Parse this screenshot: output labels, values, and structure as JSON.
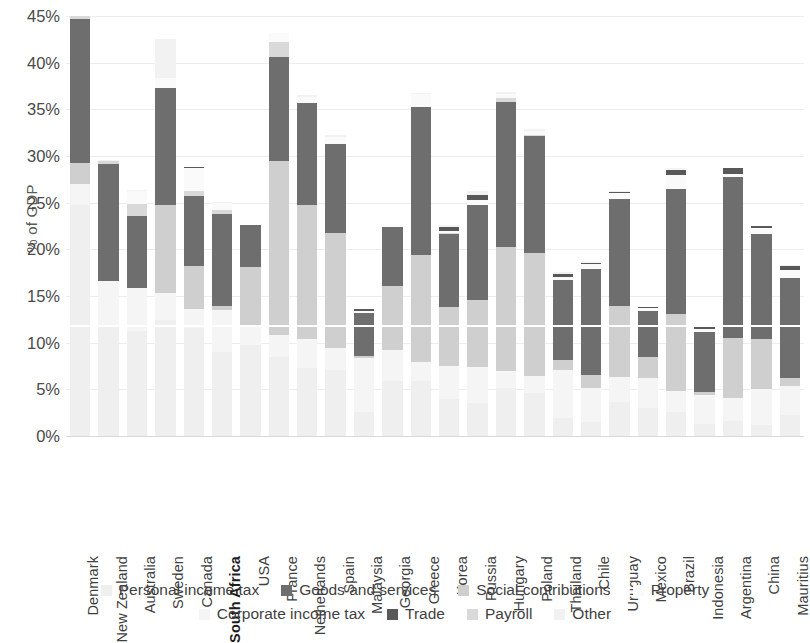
{
  "chart_data": {
    "type": "bar",
    "subtype": "stacked-bar",
    "title": "",
    "xlabel": "",
    "ylabel": "% of GDP",
    "ylim": [
      0,
      45
    ],
    "ytick_step": 5,
    "ytick_labels": [
      "0%",
      "5%",
      "10%",
      "15%",
      "20%",
      "25%",
      "30%",
      "35%",
      "40%",
      "45%"
    ],
    "grid": true,
    "legend_position": "bottom",
    "highlighted_category": "South Africa",
    "categories": [
      "Denmark",
      "New Zealand",
      "Australia",
      "Sweden",
      "Canada",
      "South Africa",
      "USA",
      "France",
      "Netherlands",
      "Spain",
      "Malaysia",
      "Georgia",
      "Greece",
      "Korea",
      "Russia",
      "Hungary",
      "Poland",
      "Thailand",
      "Chile",
      "Uruguay",
      "Mexico",
      "Brazil",
      "Indonesia",
      "Argentina",
      "China",
      "Mauritius"
    ],
    "series": [
      {
        "name": "Personal income tax",
        "color": "#efefef",
        "values": [
          24.7,
          11.9,
          11.2,
          12.4,
          11.6,
          9.0,
          9.7,
          8.5,
          7.3,
          7.1,
          2.6,
          5.9,
          5.9,
          4.0,
          3.5,
          5.1,
          4.6,
          1.9,
          1.5,
          3.6,
          3.0,
          2.6,
          1.3,
          1.6,
          1.2,
          2.2
        ]
      },
      {
        "name": "Corporate income tax",
        "color": "#f5f5f5",
        "values": [
          2.3,
          4.7,
          4.7,
          2.9,
          2.0,
          4.5,
          2.2,
          2.3,
          3.1,
          2.3,
          5.8,
          3.3,
          2.0,
          3.5,
          3.9,
          1.9,
          1.8,
          5.2,
          3.6,
          2.7,
          3.2,
          2.2,
          3.1,
          2.5,
          3.8,
          3.2
        ]
      },
      {
        "name": "Social contributions",
        "color": "#cfcfcf",
        "values": [
          2.2,
          0.0,
          0.0,
          9.4,
          4.6,
          0.4,
          6.2,
          18.7,
          14.3,
          12.3,
          0.2,
          6.9,
          11.5,
          6.3,
          7.2,
          13.2,
          13.2,
          1.0,
          1.4,
          7.6,
          2.3,
          8.3,
          0.3,
          6.4,
          5.4,
          0.8
        ]
      },
      {
        "name": "Goods and services",
        "color": "#6e6e6e",
        "values": [
          15.5,
          12.5,
          7.7,
          12.6,
          7.5,
          9.9,
          4.5,
          11.1,
          11.0,
          9.6,
          4.6,
          6.3,
          15.8,
          7.8,
          10.2,
          15.6,
          12.6,
          8.6,
          11.4,
          11.5,
          4.9,
          13.4,
          6.4,
          17.2,
          11.2,
          10.7
        ]
      },
      {
        "name": "Payroll",
        "color": "#d9d9d9",
        "values": [
          0.3,
          0.4,
          1.3,
          0.0,
          0.6,
          0.4,
          0.0,
          1.6,
          0.0,
          0.0,
          0.0,
          0.0,
          0.0,
          0.1,
          0.0,
          0.4,
          0.1,
          0.0,
          0.0,
          0.0,
          0.0,
          0.0,
          0.0,
          0.0,
          0.0,
          0.0
        ]
      },
      {
        "name": "Property",
        "color": "#fafafa",
        "values": [
          0.0,
          0.0,
          1.4,
          1.1,
          2.4,
          0.8,
          0.0,
          1.0,
          0.6,
          0.7,
          0.2,
          0.2,
          1.4,
          0.3,
          0.5,
          0.4,
          0.4,
          0.3,
          0.5,
          0.6,
          0.3,
          1.5,
          0.4,
          0.4,
          0.7,
          0.9
        ]
      },
      {
        "name": "Trade",
        "color": "#585858",
        "values": [
          0.0,
          0.0,
          0.0,
          0.0,
          0.1,
          0.0,
          0.0,
          0.0,
          0.0,
          0.0,
          0.2,
          0.0,
          0.0,
          0.4,
          0.5,
          0.0,
          0.0,
          0.4,
          0.1,
          0.1,
          0.1,
          0.5,
          0.4,
          0.6,
          0.2,
          0.4
        ]
      },
      {
        "name": "Other",
        "color": "#f2f2f2",
        "values": [
          0.0,
          0.1,
          0.1,
          4.1,
          0.0,
          0.1,
          0.0,
          0.0,
          0.2,
          0.2,
          0.0,
          0.0,
          0.2,
          0.2,
          0.4,
          0.3,
          0.2,
          0.2,
          0.1,
          0.1,
          0.0,
          0.2,
          0.0,
          0.0,
          0.0,
          0.1
        ]
      }
    ],
    "totals": [
      45.0,
      29.6,
      26.4,
      42.5,
      28.8,
      25.1,
      22.6,
      43.2,
      36.5,
      32.2,
      13.6,
      22.6,
      36.8,
      22.6,
      26.2,
      36.9,
      32.9,
      17.6,
      18.6,
      26.2,
      13.8,
      28.7,
      11.9,
      28.7,
      22.5,
      18.3
    ]
  },
  "y_axis": {
    "title": "% of GDP"
  },
  "legend": {
    "row1": [
      {
        "label": "Personal income tax",
        "color": "#efefef"
      },
      {
        "label": "Goods and services",
        "color": "#6e6e6e"
      },
      {
        "label": "Social contributions",
        "color": "#cfcfcf"
      },
      {
        "label": "Property",
        "color": "#fafafa"
      }
    ],
    "row2": [
      {
        "label": "Corporate income tax",
        "color": "#f5f5f5"
      },
      {
        "label": "Trade",
        "color": "#585858"
      },
      {
        "label": "Payroll",
        "color": "#d9d9d9"
      },
      {
        "label": "Other",
        "color": "#f2f2f2"
      }
    ]
  }
}
